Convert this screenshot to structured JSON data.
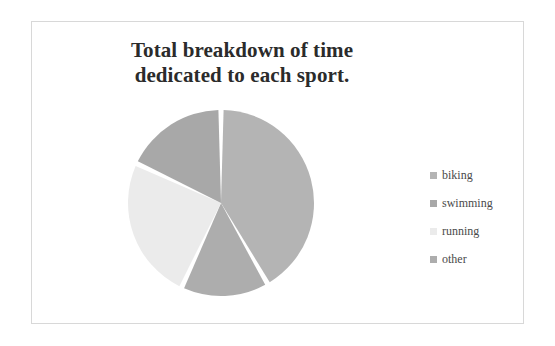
{
  "chart_data": {
    "type": "pie",
    "title": "Total breakdown of time dedicated to each sport.",
    "title_line1": "Total breakdown of time",
    "title_line2": "dedicated to each sport.",
    "categories": [
      "biking",
      "swimming",
      "running",
      "other"
    ],
    "values": [
      42,
      18,
      25,
      15
    ],
    "unit": "percent",
    "colors": [
      "#b4b4b4",
      "#a8a8a8",
      "#ebebeb",
      "#adadad"
    ],
    "legend_position": "right",
    "grid": false,
    "xlabel": "",
    "ylabel": "",
    "slices": [
      {
        "label": "biking",
        "value": 42,
        "start_angle": 0,
        "end_angle": 150,
        "color": "#b4b4b4"
      },
      {
        "label": "other",
        "value": 15,
        "start_angle": 150,
        "end_angle": 205,
        "color": "#adadad"
      },
      {
        "label": "running",
        "value": 25,
        "start_angle": 205,
        "end_angle": 295,
        "color": "#ebebeb"
      },
      {
        "label": "swimming",
        "value": 18,
        "start_angle": 295,
        "end_angle": 360,
        "color": "#a8a8a8"
      }
    ]
  },
  "legend": {
    "items": [
      {
        "label": "biking",
        "color": "#b4b4b4"
      },
      {
        "label": "swimming",
        "color": "#a8a8a8"
      },
      {
        "label": "running",
        "color": "#ebebeb"
      },
      {
        "label": "other",
        "color": "#adadad"
      }
    ]
  },
  "style": {
    "border_color": "#d8d8d8",
    "background": "#ffffff",
    "title_color": "#2b2b2b",
    "legend_text_color": "#4a4a4a",
    "slice_separator_color": "#ffffff"
  }
}
